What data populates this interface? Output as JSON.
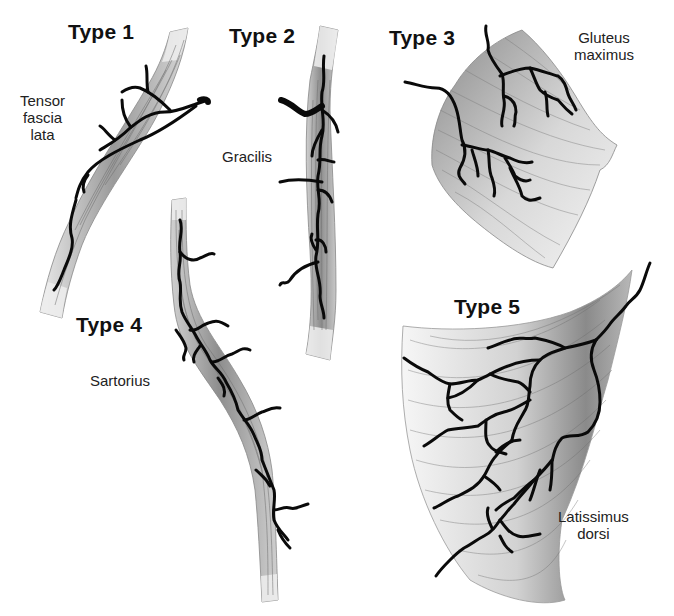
{
  "figure": {
    "panels": [
      {
        "type_label": "Type 1",
        "muscle": [
          "Tensor",
          "fascia",
          "lata"
        ]
      },
      {
        "type_label": "Type 2",
        "muscle": [
          "Gracilis"
        ]
      },
      {
        "type_label": "Type 3",
        "muscle": [
          "Gluteus",
          "maximus"
        ]
      },
      {
        "type_label": "Type 4",
        "muscle": [
          "Sartorius"
        ]
      },
      {
        "type_label": "Type 5",
        "muscle": [
          "Latissimus",
          "dorsi"
        ]
      }
    ]
  }
}
